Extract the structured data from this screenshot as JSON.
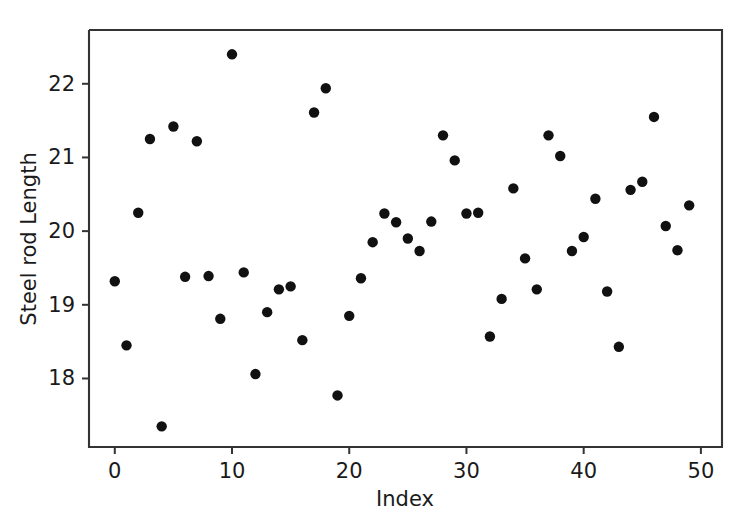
{
  "chart_data": {
    "type": "scatter",
    "title": "",
    "xlabel": "Index",
    "ylabel": "Steel rod Length",
    "xlim": [
      -2.2,
      51.8
    ],
    "ylim": [
      17.07,
      22.73
    ],
    "grid": false,
    "legend": null,
    "marker": {
      "shape": "circle",
      "color": "#111111",
      "size_px": 5.2
    },
    "xticks": [
      0,
      10,
      20,
      30,
      40,
      50
    ],
    "xticklabels": [
      "0",
      "10",
      "20",
      "30",
      "40",
      "50"
    ],
    "yticks": [
      18,
      19,
      20,
      21,
      22
    ],
    "yticklabels": [
      "18",
      "19",
      "20",
      "21",
      "22"
    ],
    "x": [
      0,
      1,
      2,
      3,
      4,
      5,
      6,
      7,
      8,
      9,
      10,
      11,
      12,
      13,
      14,
      15,
      16,
      17,
      18,
      19,
      20,
      21,
      22,
      23,
      24,
      25,
      26,
      27,
      28,
      29,
      30,
      31,
      32,
      33,
      34,
      35,
      36,
      37,
      38,
      39,
      40,
      41,
      42,
      43,
      44,
      45,
      46,
      47,
      48,
      49
    ],
    "y": [
      19.32,
      18.45,
      20.25,
      21.25,
      17.35,
      21.42,
      19.38,
      21.22,
      19.39,
      18.81,
      22.4,
      19.44,
      18.06,
      18.9,
      19.21,
      19.25,
      18.52,
      21.61,
      21.94,
      17.77,
      18.85,
      19.36,
      19.85,
      20.24,
      20.12,
      19.9,
      19.73,
      20.13,
      21.3,
      20.96,
      20.24,
      20.25,
      18.57,
      19.08,
      20.58,
      19.63,
      19.21,
      21.3,
      21.02,
      19.73,
      19.92,
      20.44,
      19.18,
      18.43,
      20.56,
      20.67,
      21.55,
      20.07,
      19.74,
      20.35
    ],
    "series_name": "Steel rod Length"
  },
  "axes": {
    "ylabel": "Steel rod Length",
    "xlabel": "Index",
    "xticklabels": [
      "0",
      "10",
      "20",
      "30",
      "40",
      "50"
    ],
    "yticklabels": [
      "18",
      "19",
      "20",
      "21",
      "22"
    ]
  },
  "colors": {
    "marker": "#111111",
    "axis": "#333333",
    "text": "#1a1a1a",
    "background": "#ffffff"
  }
}
